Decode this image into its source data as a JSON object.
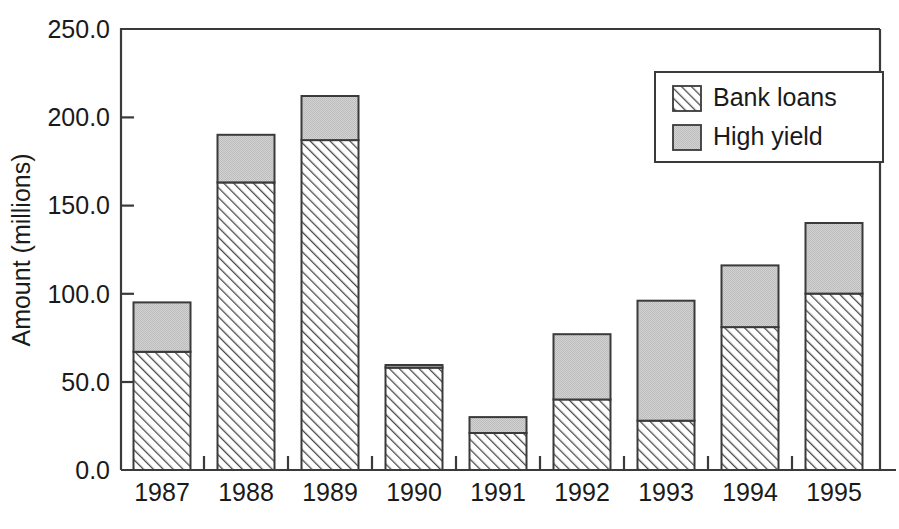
{
  "chart_data": {
    "type": "bar",
    "subtype": "stacked-vertical",
    "title": "",
    "xlabel": "",
    "ylabel": "Amount (millions)",
    "categories": [
      "1987",
      "1988",
      "1989",
      "1990",
      "1991",
      "1992",
      "1993",
      "1994",
      "1995"
    ],
    "series": [
      {
        "name": "Bank loans",
        "fill_style": "diagonal-hatch",
        "color": "#ffffff",
        "hatch_color": "#4a4a4a",
        "values": [
          67,
          163,
          187,
          58,
          21,
          40,
          28,
          81,
          100
        ]
      },
      {
        "name": "High yield",
        "fill_style": "solid-gray",
        "color": "#c9c9c9",
        "values": [
          28,
          27,
          25,
          1.5,
          9,
          37,
          68,
          35,
          40
        ]
      }
    ],
    "totals": [
      95,
      190,
      212,
      59.5,
      30,
      77,
      96,
      116,
      140
    ],
    "ylim": [
      0,
      250
    ],
    "y_ticks": [
      0,
      50,
      100,
      150,
      200,
      250
    ],
    "y_tick_labels": [
      "0.0",
      "50.0",
      "100.0",
      "150.0",
      "200.0",
      "250.0"
    ],
    "grid": false,
    "legend_position": "top-right",
    "legend_entries": [
      "Bank loans",
      "High yield"
    ]
  },
  "legend": {
    "items": [
      {
        "label": "Bank loans",
        "swatch": "hatch-swatch"
      },
      {
        "label": "High yield",
        "swatch": "gray-swatch"
      }
    ]
  },
  "axes": {
    "y_title": "Amount (millions)",
    "y_labels": [
      "250.0",
      "200.0",
      "150.0",
      "100.0",
      "50.0",
      "0.0"
    ],
    "x_labels": [
      "1987",
      "1988",
      "1989",
      "1990",
      "1991",
      "1992",
      "1993",
      "1994",
      "1995"
    ]
  },
  "colors": {
    "gray_fill": "#c9c9c9",
    "line": "#3a3a3a",
    "text": "#1a1a1a",
    "background": "#ffffff"
  }
}
